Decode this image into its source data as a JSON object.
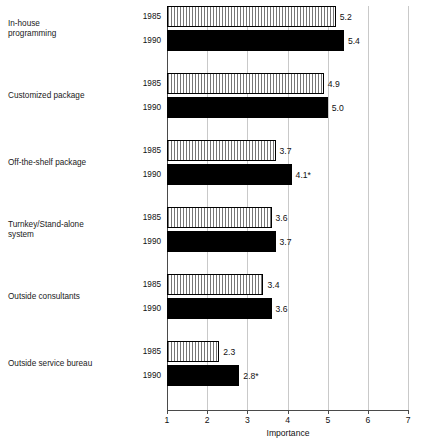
{
  "chart_data": {
    "type": "bar",
    "orientation": "horizontal",
    "title": "",
    "xlabel": "Importance",
    "ylabel": "",
    "xlim": [
      1,
      7
    ],
    "xticks": [
      1,
      2,
      3,
      4,
      5,
      6,
      7
    ],
    "grid": true,
    "legend": null,
    "categories": [
      "In-house\nprogramming",
      "Customized package",
      "Off-the-shelf package",
      "Turnkey/Stand-alone\nsystem",
      "Outside consultants",
      "Outside service bureau"
    ],
    "series": [
      {
        "name": "1985",
        "values": [
          5.2,
          4.9,
          3.7,
          3.6,
          3.4,
          2.3
        ],
        "labels": [
          "5.2",
          "4.9",
          "3.7",
          "3.6",
          "3.4",
          "2.3"
        ],
        "fill": "vertical-hatch"
      },
      {
        "name": "1990",
        "values": [
          5.4,
          5.0,
          4.1,
          3.7,
          3.6,
          2.8
        ],
        "labels": [
          "5.4",
          "5.0",
          "4.1*",
          "3.7",
          "3.6",
          "2.8*"
        ],
        "fill": "solid-black"
      }
    ],
    "annotations": [
      "* denotes significant change"
    ]
  },
  "axis": {
    "x_title": "Importance",
    "tick_labels": [
      "1",
      "2",
      "3",
      "4",
      "5",
      "6",
      "7"
    ]
  },
  "groups": [
    {
      "category": "In-house\nprogramming",
      "rows": [
        {
          "year": "1985",
          "value": 5.2,
          "label": "5.2",
          "series": "1985"
        },
        {
          "year": "1990",
          "value": 5.4,
          "label": "5.4",
          "series": "1990"
        }
      ]
    },
    {
      "category": "Customized package",
      "rows": [
        {
          "year": "1985",
          "value": 4.9,
          "label": "4.9",
          "series": "1985"
        },
        {
          "year": "1990",
          "value": 5.0,
          "label": "5.0",
          "series": "1990"
        }
      ]
    },
    {
      "category": "Off-the-shelf package",
      "rows": [
        {
          "year": "1985",
          "value": 3.7,
          "label": "3.7",
          "series": "1985"
        },
        {
          "year": "1990",
          "value": 4.1,
          "label": "4.1*",
          "series": "1990"
        }
      ]
    },
    {
      "category": "Turnkey/Stand-alone\nsystem",
      "rows": [
        {
          "year": "1985",
          "value": 3.6,
          "label": "3.6",
          "series": "1985"
        },
        {
          "year": "1990",
          "value": 3.7,
          "label": "3.7",
          "series": "1990"
        }
      ]
    },
    {
      "category": "Outside consultants",
      "rows": [
        {
          "year": "1985",
          "value": 3.4,
          "label": "3.4",
          "series": "1985"
        },
        {
          "year": "1990",
          "value": 3.6,
          "label": "3.6",
          "series": "1990"
        }
      ]
    },
    {
      "category": "Outside service bureau",
      "rows": [
        {
          "year": "1985",
          "value": 2.3,
          "label": "2.3",
          "series": "1985"
        },
        {
          "year": "1990",
          "value": 2.8,
          "label": "2.8*",
          "series": "1990"
        }
      ]
    }
  ],
  "colors": {
    "bar_1990": "#000000",
    "bar_1985_line": "#777777",
    "bar_outline": "#000000",
    "axis": "#4a4a4a",
    "gridline": "#c9c9c9",
    "text": "#111111",
    "background": "#ffffff"
  },
  "layout": {
    "plot_left_px": 167,
    "plot_top_px": 6,
    "plot_width_px": 241,
    "px_per_unit": 40.2,
    "group_pitch_px": 67,
    "row_height_px": 21,
    "row_gap_px": 3
  }
}
